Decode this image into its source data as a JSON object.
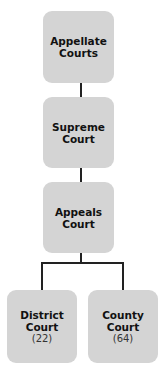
{
  "diagram": {
    "type": "hierarchy",
    "colors": {
      "box_fill": "#d4d4d4",
      "connector": "#222222",
      "text": "#111111"
    },
    "nodes": [
      {
        "id": "appellate",
        "line1": "Appellate",
        "line2": "Courts"
      },
      {
        "id": "supreme",
        "line1": "Supreme",
        "line2": "Court"
      },
      {
        "id": "appeals",
        "line1": "Appeals",
        "line2": "Court"
      },
      {
        "id": "district",
        "line1": "District",
        "line2": "Court",
        "count": "(22)"
      },
      {
        "id": "county",
        "line1": "County",
        "line2": "Court",
        "count": "(64)"
      }
    ],
    "edges": [
      [
        "appellate",
        "supreme"
      ],
      [
        "supreme",
        "appeals"
      ],
      [
        "appeals",
        "district"
      ],
      [
        "appeals",
        "county"
      ]
    ]
  }
}
